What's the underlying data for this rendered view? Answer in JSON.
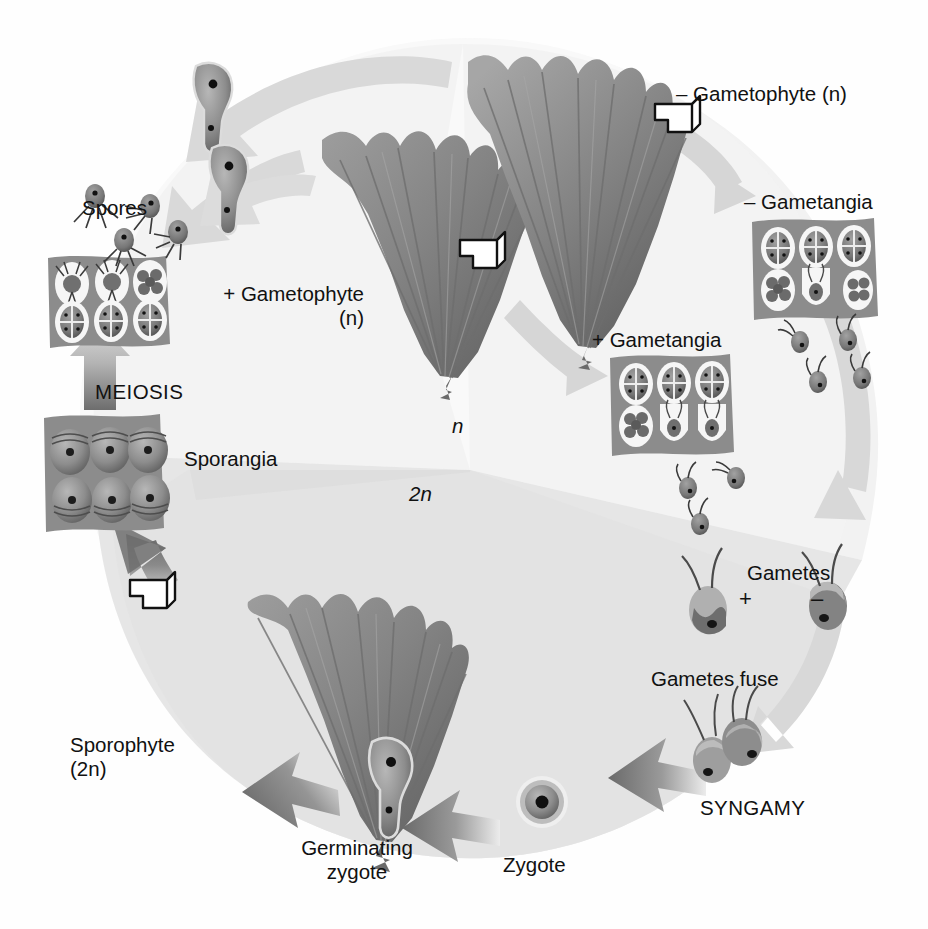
{
  "diagram": {
    "organism": "Ulva-like seaweed",
    "ploidy_regions": [
      {
        "name": "haploid-region",
        "label": "n",
        "italic": true,
        "shade": "#f3f3f3"
      },
      {
        "name": "diploid-region",
        "label": "2n",
        "italic": true,
        "shade": "#e2e2e2"
      }
    ],
    "palette": {
      "background": "#fefefe",
      "haploid_shade": "#f2f2f2",
      "diploid_shade": "#e1e1e1",
      "thallus_mid": "#8b8b8b",
      "thallus_dark": "#5e5e5e",
      "thallus_light": "#adadad",
      "tissue_gray": "#8e8e8e",
      "cell_fill": "#9a9a9a",
      "cell_dark": "#6a6a6a",
      "cell_outline": "#f4f4f4",
      "arrow_light": "#d6d6d6",
      "arrow_dark": "#6f6f6f",
      "text": "#111111"
    }
  },
  "labels": {
    "minus_gametophyte": "– Gametophyte (n)",
    "minus_gametophyte_plain": "– Gametophyte",
    "minus_gametophyte_ploidy": "(n)",
    "minus_gametangia": "– Gametangia",
    "plus_gametangia": "+ Gametangia",
    "plus_gametophyte": "+ Gametophyte",
    "plus_gametophyte_ploidy": "(n)",
    "spores": "Spores",
    "meiosis": "MEIOSIS",
    "sporangia": "Sporangia",
    "sporophyte": "Sporophyte",
    "sporophyte_ploidy": "(2n)",
    "gametes": "Gametes",
    "gamete_plus": "+",
    "gamete_minus": "–",
    "gametes_fuse": "Gametes fuse",
    "syngamy": "SYNGAMY",
    "zygote": "Zygote",
    "germinating_zygote_line1": "Germinating",
    "germinating_zygote_line2": "zygote",
    "haploid_marker": "n",
    "diploid_marker": "2n"
  },
  "structures": [
    {
      "name": "sporangia-block",
      "label": "Sporangia",
      "cells": 6,
      "rows": 2,
      "ploidy": "2n"
    },
    {
      "name": "spore-release-block",
      "label": "Spores",
      "cells": 6,
      "rows": 2,
      "ploidy": "n"
    },
    {
      "name": "plus-gametangia-block",
      "label": "+ Gametangia",
      "cells": 6,
      "rows": 2,
      "ploidy": "n"
    },
    {
      "name": "minus-gametangia-block",
      "label": "– Gametangia",
      "cells": 6,
      "rows": 2,
      "ploidy": "n"
    },
    {
      "name": "plus-gametophyte-thallus",
      "label": "+ Gametophyte (n)",
      "ploidy": "n"
    },
    {
      "name": "minus-gametophyte-thallus",
      "label": "– Gametophyte (n)",
      "ploidy": "n"
    },
    {
      "name": "sporophyte-thallus",
      "label": "Sporophyte (2n)",
      "ploidy": "2n"
    },
    {
      "name": "zygote-cell",
      "label": "Zygote",
      "ploidy": "2n"
    },
    {
      "name": "germinating-zygote-cell",
      "label": "Germinating zygote",
      "ploidy": "2n"
    }
  ],
  "cells": {
    "spore_flagella": 4,
    "gamete_flagella": 2,
    "zygote_flagella": 4
  },
  "callouts": [
    {
      "name": "callout-marker-minus-gametophyte"
    },
    {
      "name": "callout-marker-plus-gametophyte"
    },
    {
      "name": "callout-marker-sporophyte"
    }
  ],
  "arrows": [
    {
      "name": "arrow-spores-to-gametophyte-upper",
      "tone": "light"
    },
    {
      "name": "arrow-spores-to-gametophyte-lower",
      "tone": "light"
    },
    {
      "name": "arrow-germinating-spore-up",
      "tone": "light"
    },
    {
      "name": "arrow-gametophyte-to-minus-gametangia",
      "tone": "light"
    },
    {
      "name": "arrow-gametophyte-to-plus-gametangia",
      "tone": "light"
    },
    {
      "name": "arrow-gametangia-to-gametes",
      "tone": "light"
    },
    {
      "name": "arrow-gametes-to-syngamy",
      "tone": "light"
    },
    {
      "name": "arrow-syngamy-to-zygote",
      "tone": "dark"
    },
    {
      "name": "arrow-zygote-to-germinating-zygote",
      "tone": "dark"
    },
    {
      "name": "arrow-germinating-zygote-to-sporophyte",
      "tone": "dark"
    },
    {
      "name": "arrow-sporophyte-to-sporangia",
      "tone": "dark"
    },
    {
      "name": "arrow-meiosis",
      "tone": "gradient"
    }
  ]
}
